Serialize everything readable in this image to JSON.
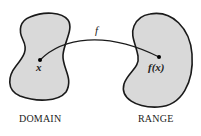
{
  "diagram": {
    "type": "function-mapping",
    "colors": {
      "blob_fill": "#d9d9d9",
      "stroke": "#1a1a1a",
      "background": "#ffffff"
    },
    "domain": {
      "caption": "DOMAIN",
      "point_label": "x"
    },
    "range": {
      "caption": "RANGE",
      "point_label": "f(x)"
    },
    "arrow": {
      "label": "f"
    }
  }
}
